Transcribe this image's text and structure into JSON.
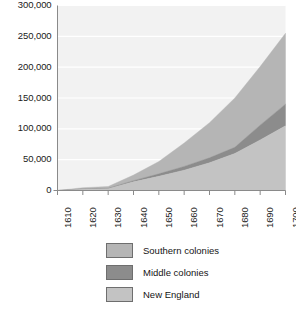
{
  "chart_data": {
    "type": "area",
    "stacked": true,
    "title": "",
    "subtitle": "",
    "xlabel": "",
    "ylabel": "",
    "x": [
      1610,
      1620,
      1630,
      1640,
      1650,
      1660,
      1670,
      1680,
      1690,
      1700
    ],
    "categories": [
      "1610",
      "1620",
      "1630",
      "1640",
      "1650",
      "1660",
      "1670",
      "1680",
      "1690",
      "1700"
    ],
    "xlim": [
      1610,
      1700
    ],
    "ylim": [
      0,
      300000
    ],
    "ytick_values": [
      0,
      50000,
      100000,
      150000,
      200000,
      250000,
      300000
    ],
    "ytick_labels": [
      "0",
      "50,000",
      "100,000",
      "150,000",
      "200,000",
      "250,000",
      "300,000"
    ],
    "xtick_labels": [
      "1610",
      "1620",
      "1630",
      "1640",
      "1650",
      "1660",
      "1670",
      "1680",
      "1690",
      "1700"
    ],
    "grid": true,
    "grid_axis": "y",
    "legend_position": "bottom",
    "series": [
      {
        "name": "New England",
        "color": "#c3c3c3",
        "stack_order": 0,
        "values": [
          0,
          2000,
          3000,
          14000,
          23000,
          33000,
          45000,
          60000,
          82000,
          105000
        ]
      },
      {
        "name": "Middle colonies",
        "color": "#8c8c8c",
        "stack_order": 1,
        "values": [
          0,
          500,
          500,
          2000,
          4000,
          6000,
          8000,
          10000,
          24000,
          35000
        ]
      },
      {
        "name": "Southern colonies",
        "color": "#b5b5b5",
        "stack_order": 2,
        "values": [
          0,
          2000,
          3000,
          9000,
          20000,
          38000,
          57000,
          80000,
          95000,
          115000
        ]
      }
    ],
    "totals": [
      0,
      4500,
      6500,
      25000,
      47000,
      77000,
      110000,
      150000,
      201000,
      255000
    ]
  },
  "legend": {
    "items": [
      {
        "label": "Southern colonies",
        "color": "#b5b5b5"
      },
      {
        "label": "Middle colonies",
        "color": "#8c8c8c"
      },
      {
        "label": "New England",
        "color": "#c3c3c3"
      }
    ]
  },
  "colors": {
    "plot_background": "#f2f2f2",
    "gridline": "#ffffff",
    "axis": "#8a8a8a",
    "text": "#141414"
  }
}
